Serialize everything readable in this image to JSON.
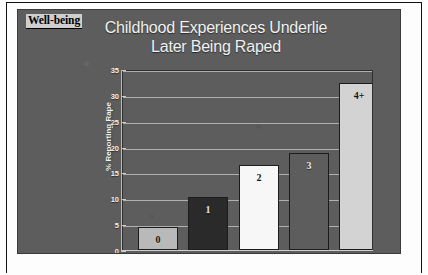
{
  "slide": {
    "section_tab": "Well-being",
    "title_line_1": "Childhood Experiences Underlie",
    "title_line_2": "Later Being Raped",
    "background_color": "#5d5d5d",
    "title_color": "#f2f2f2"
  },
  "chart_data": {
    "type": "bar",
    "title": "Childhood Experiences Underlie Later Being Raped",
    "xlabel": "",
    "ylabel": "% Reporting Rape",
    "categories": [
      "0",
      "1",
      "2",
      "3",
      "4+"
    ],
    "values": [
      4.5,
      10.2,
      16.5,
      18.7,
      32.2
    ],
    "bar_labels": [
      "0",
      "1",
      "2",
      "3",
      "4+"
    ],
    "bar_colors": [
      "#b9b9b9",
      "#2a2a2a",
      "#f7f7f7",
      "#5d5d5d",
      "#d3d3d3"
    ],
    "ylim": [
      0,
      35
    ],
    "yticks": [
      0,
      5,
      10,
      15,
      20,
      25,
      30,
      35
    ],
    "ytick_labels": [
      "0",
      "5",
      "10",
      "15",
      "20",
      "25",
      "30",
      "35"
    ],
    "grid": true,
    "grid_color": "#bdbdbd",
    "legend": "none",
    "plot_background": "#5d5d5d"
  }
}
